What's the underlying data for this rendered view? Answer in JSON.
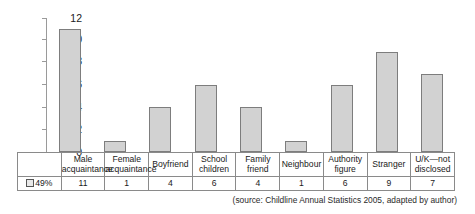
{
  "chart_data": {
    "type": "bar",
    "title": "",
    "xlabel": "",
    "ylabel": "",
    "ylim": [
      0,
      12
    ],
    "ytick_step": 2,
    "yticks": [
      0,
      2,
      4,
      6,
      8,
      10,
      12
    ],
    "grid": false,
    "legend_position": "table-left",
    "categories": [
      "Male acquaintance",
      "Female acquaintance",
      "Boyfriend",
      "School children",
      "Family friend",
      "Neighbour",
      "Authority figure",
      "Stranger",
      "U/K—not disclosed"
    ],
    "category_lines": [
      [
        "Male",
        "acquaintance"
      ],
      [
        "Female",
        "acquaintance"
      ],
      [
        "Boyfriend"
      ],
      [
        "School",
        "children"
      ],
      [
        "Family",
        "friend"
      ],
      [
        "Neighbour"
      ],
      [
        "Authority",
        "figure"
      ],
      [
        "Stranger"
      ],
      [
        "U/K—not",
        "disclosed"
      ]
    ],
    "values": [
      11,
      1,
      4,
      6,
      4,
      1,
      6,
      9,
      7
    ],
    "series": [
      {
        "name": "49%",
        "values": [
          11,
          1,
          4,
          6,
          4,
          1,
          6,
          9,
          7
        ]
      }
    ],
    "colors": {
      "bar_fill": "#d2d2d2",
      "bar_border": "#7d7d7d",
      "axis": "#9a9a9a",
      "grid_border": "#8a8a8a",
      "text": "#1a1a1a"
    }
  },
  "legend": {
    "swatch_icon": "legend-swatch-icon",
    "label": "49%"
  },
  "caption": {
    "source": "(source: Childline Annual Statistics 2005, adapted by author)"
  }
}
